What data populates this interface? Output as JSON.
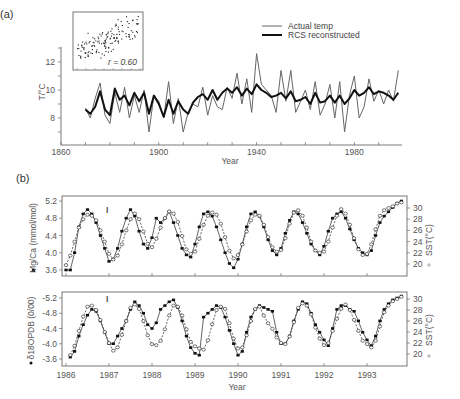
{
  "chart_data": [
    {
      "id": "a",
      "type": "line",
      "panel_label": "(a)",
      "xlabel": "Year",
      "ylabel": "T/°C",
      "xlim": [
        1860,
        2000
      ],
      "ylim": [
        6.5,
        13
      ],
      "xticks": [
        1860,
        1900,
        1940,
        1980
      ],
      "yticks": [
        8,
        10,
        12
      ],
      "legend": {
        "position": "upper right",
        "entries": [
          "Actual temp",
          "RCS reconstructed"
        ]
      },
      "inset": {
        "type": "scatter",
        "annotation": "r = 0.60",
        "points": 150
      },
      "x": [
        1870,
        1872,
        1874,
        1876,
        1878,
        1880,
        1882,
        1884,
        1886,
        1888,
        1890,
        1892,
        1894,
        1896,
        1898,
        1900,
        1902,
        1904,
        1906,
        1908,
        1910,
        1912,
        1914,
        1916,
        1918,
        1920,
        1922,
        1924,
        1926,
        1928,
        1930,
        1932,
        1934,
        1936,
        1938,
        1940,
        1942,
        1944,
        1946,
        1948,
        1950,
        1952,
        1954,
        1956,
        1958,
        1960,
        1962,
        1964,
        1966,
        1968,
        1970,
        1972,
        1974,
        1976,
        1978,
        1980,
        1982,
        1984,
        1986,
        1988,
        1990,
        1992,
        1994,
        1996,
        1998
      ],
      "series": [
        {
          "name": "Actual temp",
          "color": "#666666",
          "width": 1,
          "values": [
            8.7,
            8.0,
            9.4,
            10.5,
            8.2,
            7.6,
            9.8,
            8.4,
            10.2,
            8.0,
            9.6,
            8.4,
            10.0,
            7.0,
            9.6,
            9.2,
            8.0,
            10.6,
            7.6,
            9.4,
            7.0,
            8.4,
            9.0,
            8.8,
            10.2,
            8.2,
            9.6,
            8.8,
            8.6,
            10.2,
            9.4,
            11.2,
            9.0,
            10.8,
            8.4,
            12.6,
            10.4,
            10.0,
            9.6,
            8.4,
            11.4,
            9.2,
            11.4,
            8.4,
            9.2,
            10.0,
            8.6,
            10.6,
            8.2,
            9.0,
            10.4,
            8.0,
            10.6,
            7.0,
            9.6,
            11.0,
            8.0,
            8.8,
            10.8,
            9.2,
            10.0,
            9.0,
            10.0,
            9.2,
            11.4
          ]
        },
        {
          "name": "RCS reconstructed",
          "color": "#111111",
          "width": 2,
          "values": [
            8.6,
            8.3,
            8.8,
            9.9,
            8.6,
            8.2,
            10.1,
            9.3,
            9.6,
            8.9,
            9.8,
            9.2,
            9.8,
            8.3,
            9.6,
            9.0,
            8.1,
            9.3,
            8.3,
            9.2,
            8.6,
            8.3,
            9.1,
            9.5,
            9.7,
            9.3,
            10.0,
            9.3,
            9.8,
            10.1,
            9.8,
            10.2,
            9.6,
            10.1,
            9.7,
            10.4,
            10.0,
            9.8,
            9.5,
            9.6,
            9.8,
            9.4,
            9.9,
            9.2,
            9.3,
            9.5,
            9.0,
            9.8,
            9.1,
            9.2,
            9.6,
            9.1,
            9.6,
            9.0,
            9.4,
            10.0,
            9.6,
            9.8,
            10.2,
            9.7,
            9.9,
            9.8,
            9.6,
            9.3,
            9.8
          ]
        }
      ]
    },
    {
      "id": "b-top",
      "type": "line",
      "panel_label": "(b)",
      "xlabel": "",
      "ylabel": "Mg/Ca (mmol/mol)",
      "ylabel_right": "SST(°C)",
      "xlim": [
        1986,
        1993.95
      ],
      "ylim": [
        3.5,
        5.3
      ],
      "ylim_right": [
        18.7,
        31.3
      ],
      "yticks": [
        3.6,
        4.0,
        4.4,
        4.8,
        5.2
      ],
      "yticks_right": [
        20,
        22,
        24,
        26,
        28,
        30
      ],
      "error_bar": "I",
      "series": [
        {
          "name": "Mg/Ca",
          "marker": "filled-square",
          "axis": "left",
          "x": [
            1986.0,
            1986.1,
            1986.2,
            1986.3,
            1986.4,
            1986.5,
            1986.6,
            1986.7,
            1986.8,
            1986.9,
            1987.0,
            1987.1,
            1987.2,
            1987.3,
            1987.4,
            1987.5,
            1987.6,
            1987.7,
            1987.8,
            1987.9,
            1988.0,
            1988.1,
            1988.2,
            1988.3,
            1988.4,
            1988.5,
            1988.6,
            1988.7,
            1988.8,
            1988.9,
            1989.0,
            1989.1,
            1989.2,
            1989.3,
            1989.4,
            1989.5,
            1989.6,
            1989.7,
            1989.8,
            1989.9,
            1990.0,
            1990.1,
            1990.2,
            1990.3,
            1990.4,
            1990.5,
            1990.6,
            1990.7,
            1990.8,
            1990.9,
            1991.0,
            1991.1,
            1991.2,
            1991.3,
            1991.4,
            1991.5,
            1991.6,
            1991.7,
            1991.8,
            1991.9,
            1992.0,
            1992.1,
            1992.2,
            1992.3,
            1992.4,
            1992.5,
            1992.6,
            1992.7,
            1992.8,
            1992.9,
            1993.0,
            1993.1,
            1993.2,
            1993.3,
            1993.4,
            1993.5,
            1993.6,
            1993.7,
            1993.8
          ],
          "values": [
            3.6,
            3.6,
            4.0,
            4.6,
            4.9,
            5.0,
            4.9,
            4.7,
            4.4,
            4.1,
            3.8,
            3.85,
            4.1,
            4.5,
            4.8,
            5.0,
            4.85,
            4.5,
            4.2,
            4.1,
            4.35,
            4.8,
            4.7,
            4.8,
            4.95,
            4.7,
            4.4,
            4.1,
            3.95,
            3.9,
            4.2,
            4.6,
            4.9,
            4.95,
            4.85,
            4.6,
            4.3,
            4.0,
            3.75,
            3.65,
            3.85,
            4.2,
            4.6,
            4.9,
            4.95,
            4.85,
            4.6,
            4.3,
            4.05,
            3.95,
            4.1,
            4.45,
            4.75,
            4.95,
            4.9,
            4.7,
            4.45,
            4.2,
            4.05,
            3.95,
            4.15,
            4.5,
            4.8,
            4.9,
            4.95,
            4.8,
            4.55,
            4.3,
            4.1,
            4.0,
            3.95,
            4.05,
            4.4,
            4.7,
            4.85,
            4.95,
            5.05,
            5.15,
            5.2
          ]
        },
        {
          "name": "SST",
          "marker": "open-circle",
          "axis": "right",
          "x": [
            1986.0,
            1986.1,
            1986.2,
            1986.3,
            1986.4,
            1986.5,
            1986.6,
            1986.7,
            1986.8,
            1986.9,
            1987.0,
            1987.1,
            1987.2,
            1987.3,
            1987.4,
            1987.5,
            1987.6,
            1987.7,
            1987.8,
            1987.9,
            1988.0,
            1988.1,
            1988.2,
            1988.3,
            1988.4,
            1988.5,
            1988.6,
            1988.7,
            1988.8,
            1988.9,
            1989.0,
            1989.1,
            1989.2,
            1989.3,
            1989.4,
            1989.5,
            1989.6,
            1989.7,
            1989.8,
            1989.9,
            1990.0,
            1990.1,
            1990.2,
            1990.3,
            1990.4,
            1990.5,
            1990.6,
            1990.7,
            1990.8,
            1990.9,
            1991.0,
            1991.1,
            1991.2,
            1991.3,
            1991.4,
            1991.5,
            1991.6,
            1991.7,
            1991.8,
            1991.9,
            1992.0,
            1992.1,
            1992.2,
            1992.3,
            1992.4,
            1992.5,
            1992.6,
            1992.7,
            1992.8,
            1992.9,
            1993.0,
            1993.1,
            1993.2,
            1993.3,
            1993.4,
            1993.5,
            1993.6,
            1993.7,
            1993.8
          ],
          "values": [
            19.8,
            21.5,
            24.0,
            26.5,
            28.0,
            28.8,
            28.6,
            27.8,
            26.0,
            24.0,
            21.8,
            20.8,
            21.5,
            23.5,
            26.0,
            28.0,
            29.0,
            28.0,
            25.8,
            23.6,
            23.0,
            24.5,
            26.5,
            28.2,
            29.4,
            29.0,
            27.5,
            25.0,
            22.6,
            21.8,
            22.2,
            24.5,
            27.0,
            28.6,
            29.2,
            28.8,
            27.2,
            24.8,
            22.4,
            21.0,
            21.6,
            23.5,
            25.8,
            27.8,
            28.8,
            28.6,
            27.0,
            24.8,
            23.0,
            22.2,
            22.5,
            24.6,
            27.2,
            29.2,
            29.6,
            28.6,
            26.5,
            24.0,
            22.4,
            22.0,
            22.2,
            24.0,
            26.5,
            28.6,
            29.8,
            29.0,
            27.0,
            24.6,
            22.6,
            21.6,
            21.8,
            23.5,
            26.2,
            28.6,
            29.6,
            30.0,
            30.3,
            30.8,
            31.0
          ]
        }
      ]
    },
    {
      "id": "b-bottom",
      "type": "line",
      "xlabel": "Year",
      "ylabel": "δ18OPDB (0/00)",
      "ylabel_right": "SST(°C)",
      "xlim": [
        1986,
        1993.95
      ],
      "ylim": [
        -3.5,
        -5.3
      ],
      "ylim_right": [
        18.9,
        31.2
      ],
      "xticks": [
        1986,
        1987,
        1988,
        1989,
        1990,
        1991,
        1992,
        1993
      ],
      "yticks": [
        -3.6,
        -4.0,
        -4.4,
        -4.8,
        -5.2
      ],
      "yticks_right": [
        20,
        22,
        24,
        26,
        28,
        30
      ],
      "error_bar": "I",
      "series": [
        {
          "name": "δ18O",
          "marker": "filled-square",
          "axis": "left",
          "x": [
            1986.1,
            1986.2,
            1986.3,
            1986.4,
            1986.5,
            1986.6,
            1986.7,
            1986.8,
            1986.9,
            1987.0,
            1987.1,
            1987.2,
            1987.3,
            1987.4,
            1987.5,
            1987.6,
            1987.7,
            1987.8,
            1987.9,
            1988.0,
            1988.1,
            1988.2,
            1988.3,
            1988.4,
            1988.5,
            1988.6,
            1988.7,
            1988.8,
            1988.9,
            1989.0,
            1989.1,
            1989.2,
            1989.3,
            1989.4,
            1989.5,
            1989.6,
            1989.7,
            1989.8,
            1989.9,
            1990.0,
            1990.1,
            1990.2,
            1990.3,
            1990.4,
            1990.5,
            1990.6,
            1990.7,
            1990.8,
            1990.9,
            1991.0,
            1991.1,
            1991.2,
            1991.3,
            1991.4,
            1991.5,
            1991.6,
            1991.7,
            1991.8,
            1991.9,
            1992.0,
            1992.1,
            1992.2,
            1992.3,
            1992.4,
            1992.5,
            1992.6,
            1992.7,
            1992.8,
            1992.9,
            1993.0,
            1993.1,
            1993.2,
            1993.3,
            1993.4,
            1993.5,
            1993.6,
            1993.7,
            1993.8
          ],
          "values": [
            -3.65,
            -3.8,
            -4.2,
            -4.5,
            -4.75,
            -4.9,
            -4.85,
            -4.6,
            -4.3,
            -4.0,
            -4.0,
            -4.2,
            -4.4,
            -4.6,
            -4.9,
            -5.1,
            -5.0,
            -4.8,
            -4.5,
            -4.4,
            -4.55,
            -4.9,
            -5.0,
            -5.1,
            -5.15,
            -4.95,
            -4.6,
            -4.2,
            -3.9,
            -3.75,
            -3.7,
            -4.7,
            -4.8,
            -4.9,
            -5.0,
            -4.95,
            -4.7,
            -4.35,
            -4.0,
            -3.7,
            -3.8,
            -4.3,
            -4.7,
            -4.9,
            -5.0,
            -4.95,
            -4.9,
            -4.85,
            -4.3,
            -4.0,
            -4.0,
            -4.2,
            -4.6,
            -4.9,
            -5.1,
            -5.05,
            -4.8,
            -4.5,
            -4.3,
            -4.1,
            -3.95,
            -4.4,
            -4.9,
            -5.0,
            -5.0,
            -4.9,
            -4.85,
            -4.6,
            -4.3,
            -4.1,
            -3.95,
            -4.2,
            -4.6,
            -4.9,
            -5.05,
            -5.15,
            -5.2,
            -5.25
          ]
        },
        {
          "name": "SST",
          "marker": "open-circle",
          "axis": "right",
          "x": [
            1986.1,
            1986.2,
            1986.3,
            1986.4,
            1986.5,
            1986.6,
            1986.7,
            1986.8,
            1986.9,
            1987.0,
            1987.1,
            1987.2,
            1987.3,
            1987.4,
            1987.5,
            1987.6,
            1987.7,
            1987.8,
            1987.9,
            1988.0,
            1988.1,
            1988.2,
            1988.3,
            1988.4,
            1988.5,
            1988.6,
            1988.7,
            1988.8,
            1988.9,
            1989.0,
            1989.1,
            1989.2,
            1989.3,
            1989.4,
            1989.5,
            1989.6,
            1989.7,
            1989.8,
            1989.9,
            1990.0,
            1990.1,
            1990.2,
            1990.3,
            1990.4,
            1990.5,
            1990.6,
            1990.7,
            1990.8,
            1990.9,
            1991.0,
            1991.1,
            1991.2,
            1991.3,
            1991.4,
            1991.5,
            1991.6,
            1991.7,
            1991.8,
            1991.9,
            1992.0,
            1992.1,
            1992.2,
            1992.3,
            1992.4,
            1992.5,
            1992.6,
            1992.7,
            1992.8,
            1992.9,
            1993.0,
            1993.1,
            1993.2,
            1993.3,
            1993.4,
            1993.5,
            1993.6,
            1993.7,
            1993.8
          ],
          "values": [
            19.8,
            21.5,
            24.2,
            26.8,
            28.6,
            28.8,
            28.0,
            26.2,
            24.0,
            22.0,
            20.6,
            21.2,
            23.5,
            26.0,
            28.4,
            29.0,
            28.2,
            26.0,
            23.4,
            21.8,
            21.6,
            22.4,
            24.5,
            27.0,
            28.8,
            28.6,
            27.0,
            24.5,
            22.2,
            21.4,
            21.0,
            20.8,
            22.5,
            25.4,
            28.0,
            28.6,
            28.2,
            25.6,
            22.8,
            21.0,
            21.2,
            23.4,
            26.0,
            28.2,
            28.6,
            27.0,
            25.6,
            24.6,
            23.0,
            22.0,
            21.8,
            23.2,
            25.8,
            28.4,
            29.2,
            28.8,
            27.2,
            24.8,
            22.8,
            21.6,
            22.0,
            24.2,
            26.4,
            28.2,
            29.0,
            28.0,
            26.2,
            24.2,
            22.4,
            21.8,
            21.2,
            22.4,
            25.0,
            27.6,
            28.8,
            29.6,
            30.0,
            30.4
          ]
        }
      ]
    }
  ],
  "labels": {
    "panel_a": "(a)",
    "panel_b": "(b)",
    "legend_actual": "Actual temp",
    "legend_rcs": "RCS reconstructed",
    "inset_r": "r = 0.60",
    "a_ylabel": "T/°C",
    "a_xlabel": "Year",
    "b_top_ylabel": "Mg/Ca (mmol/mol)",
    "b_bottom_ylabel": "δ18OPDB (0/00)",
    "b_right_ylabel": "SST(°C)",
    "b_xlabel": "Year",
    "error_bar": "I"
  },
  "colors": {
    "axis": "#555555",
    "thin_line": "#666666",
    "thick_line": "#111111",
    "marker": "#111111"
  }
}
